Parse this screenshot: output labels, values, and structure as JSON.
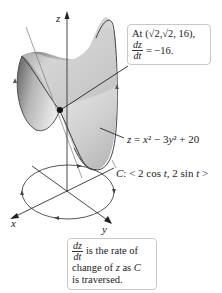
{
  "figure": {
    "axes": {
      "z_label": "z",
      "x_label": "x",
      "y_label": "y"
    },
    "surface": {
      "equation_label": "z = x² − 3y² + 20",
      "eq_z": "z",
      "eq_x": "x",
      "eq_rest1": "² − 3",
      "eq_y": "y",
      "eq_rest2": "² + 20"
    },
    "curve": {
      "label_C": "C",
      "label_rest": ": < 2 cos ",
      "t1": "t",
      "mid": ", 2 sin ",
      "t2": "t",
      "end": " >",
      "full_label": "C: < 2 cos t, 2 sin t >"
    },
    "point_callout": {
      "line1": "At (√2,√2, 16),",
      "frac_num": "dz",
      "frac_den": "dt",
      "value": "= −16."
    },
    "rate_callout": {
      "frac_num": "dz",
      "frac_den": "dt",
      "line1_rest": "is the rate of",
      "line2_pre": "change of ",
      "line2_z": "z",
      "line2_mid": " as ",
      "line2_C": "C",
      "line3": "is traversed."
    },
    "colors": {
      "surface_dark": "#6e6e6e",
      "surface_light": "#e6e6e6",
      "outline": "#444444",
      "axis": "#333333",
      "callout_border": "#c8c8c8"
    }
  }
}
